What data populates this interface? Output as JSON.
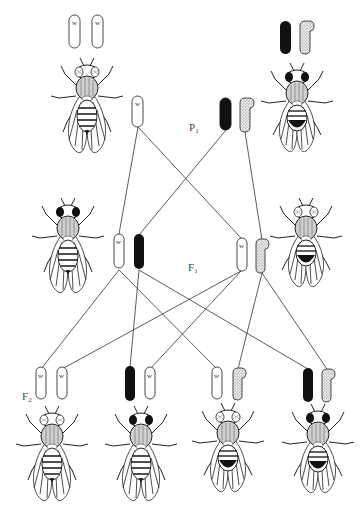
{
  "diagram": {
    "title": "",
    "type": "drosophila-sex-linked-inheritance-cross",
    "colors": {
      "line": "#333333",
      "chrom_white": "#ffffff",
      "chrom_black": "#111111",
      "chrom_dotted": "#d8d8d8",
      "fly_ink": "#222222",
      "fly_dark": "#1a1a1a"
    },
    "generations": [
      {
        "id": "P1",
        "label": "P",
        "sub": "1"
      },
      {
        "id": "F1",
        "label": "F",
        "sub": "1"
      },
      {
        "id": "F2",
        "label": "F",
        "sub": "2"
      }
    ],
    "allele_label": "w",
    "chromosome_types": {
      "white": "X chromosome carrying w (white-eye) allele",
      "black": "X chromosome carrying wild-type (red-eye) allele",
      "dotted": "Y chromosome (hooked)"
    },
    "flies": [
      {
        "id": "p-female",
        "generation": "P1",
        "sex": "female",
        "eye": "white",
        "chromosomes": [
          "white",
          "white"
        ]
      },
      {
        "id": "p-male",
        "generation": "P1",
        "sex": "male",
        "eye": "red",
        "chromosomes": [
          "black",
          "dotted"
        ]
      },
      {
        "id": "f1-female",
        "generation": "F1",
        "sex": "female",
        "eye": "red",
        "chromosomes": [
          "white",
          "black"
        ]
      },
      {
        "id": "f1-male",
        "generation": "F1",
        "sex": "male",
        "eye": "white",
        "chromosomes": [
          "white",
          "dotted"
        ]
      },
      {
        "id": "f2-female-white",
        "generation": "F2",
        "sex": "female",
        "eye": "white",
        "chromosomes": [
          "white",
          "white"
        ]
      },
      {
        "id": "f2-female-red",
        "generation": "F2",
        "sex": "female",
        "eye": "red",
        "chromosomes": [
          "black",
          "white"
        ]
      },
      {
        "id": "f2-male-white",
        "generation": "F2",
        "sex": "male",
        "eye": "white",
        "chromosomes": [
          "white",
          "dotted"
        ]
      },
      {
        "id": "f2-male-red",
        "generation": "F2",
        "sex": "male",
        "eye": "red",
        "chromosomes": [
          "black",
          "dotted"
        ]
      }
    ]
  }
}
